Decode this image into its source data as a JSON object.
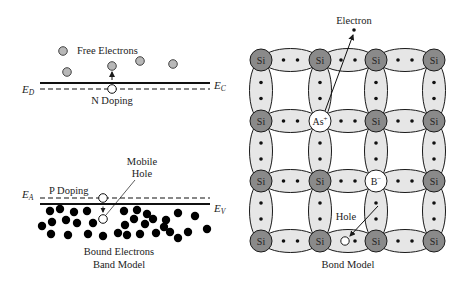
{
  "band_model": {
    "title": "Band Model",
    "n_doping": {
      "label": "N Doping",
      "free_electrons_label": "Free Electrons",
      "ec_label": "E",
      "ec_sub": "C",
      "ed_label": "E",
      "ed_sub": "D",
      "free_electrons": [
        [
          63,
          51
        ],
        [
          67,
          72
        ],
        [
          112,
          66
        ],
        [
          140,
          61
        ],
        [
          173,
          64
        ]
      ],
      "donor_site": [
        112,
        89
      ]
    },
    "p_doping": {
      "label": "P Doping",
      "mobile_hole_label_1": "Mobile",
      "mobile_hole_label_2": "Hole",
      "ea_label": "E",
      "ea_sub": "A",
      "ev_label": "E",
      "ev_sub": "V",
      "acceptor_site": [
        103,
        198
      ],
      "mobile_hole": [
        103,
        219
      ],
      "bound_electrons_label": "Bound Electrons",
      "bound_electrons": [
        [
          50,
          211
        ],
        [
          60,
          209
        ],
        [
          74,
          212
        ],
        [
          87,
          211
        ],
        [
          42,
          226
        ],
        [
          52,
          222
        ],
        [
          66,
          220
        ],
        [
          77,
          223
        ],
        [
          93,
          223
        ],
        [
          51,
          234
        ],
        [
          68,
          235
        ],
        [
          88,
          234
        ],
        [
          103,
          236
        ],
        [
          124,
          211
        ],
        [
          134,
          219
        ],
        [
          137,
          210
        ],
        [
          147,
          214
        ],
        [
          153,
          219
        ],
        [
          166,
          220
        ],
        [
          178,
          213
        ],
        [
          195,
          216
        ],
        [
          125,
          225
        ],
        [
          145,
          224
        ],
        [
          164,
          227
        ],
        [
          118,
          233
        ],
        [
          127,
          235
        ],
        [
          140,
          234
        ],
        [
          156,
          233
        ],
        [
          170,
          232
        ],
        [
          178,
          238
        ],
        [
          188,
          232
        ],
        [
          207,
          229
        ]
      ]
    }
  },
  "bond_model": {
    "title": "Bond Model",
    "electron_label": "Electron",
    "hole_label": "Hole",
    "columns": [
      261,
      320,
      376,
      434
    ],
    "rows": [
      60,
      121,
      181,
      241
    ],
    "atoms": [
      [
        "Si",
        "Si",
        "Si",
        "Si"
      ],
      [
        "Si",
        "As+",
        "Si",
        "Si"
      ],
      [
        "Si",
        "Si",
        "B−",
        "Si"
      ],
      [
        "Si",
        "Si",
        "Si",
        "Si"
      ]
    ],
    "free_electron": [
      354,
      30
    ],
    "hole_position": [
      345,
      241
    ],
    "colors": {
      "si_fill": "#8a8a8a",
      "bond_fill": "#e6e6e6",
      "dopant_fill": "#ffffff",
      "stroke": "#1a1a1a",
      "free_electron_fill": "#b8b8b8"
    }
  }
}
